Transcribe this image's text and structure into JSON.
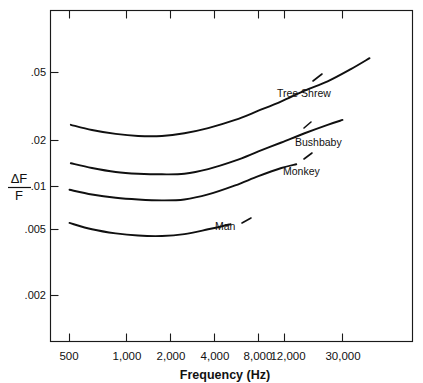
{
  "chart_data": {
    "type": "line",
    "title": "",
    "xlabel": "Frequency  (Hz)",
    "ylabel": "ΔF / F",
    "ylabel_numerator": "ΔF",
    "ylabel_denominator": "F",
    "xscale": "log",
    "yscale": "log",
    "xlim": [
      430,
      60000
    ],
    "ylim": [
      0.0013,
      0.085
    ],
    "grid": false,
    "legend": "inline-labels",
    "xticks": [
      500,
      1000,
      2000,
      4000,
      8000,
      12000,
      30000
    ],
    "xtick_labels": [
      "500",
      "1,000",
      "2,000",
      "4,000",
      "8,000",
      "12,000",
      "30,000"
    ],
    "yticks": [
      0.05,
      0.02,
      0.01,
      0.005,
      0.002
    ],
    "ytick_labels": [
      ".05",
      ".02",
      ".01",
      ".005",
      ".002"
    ],
    "series": [
      {
        "name": "Tree Shrew",
        "label": "Tree Shrew",
        "x": [
          510,
          700,
          1000,
          1400,
          2000,
          2800,
          4000,
          6000,
          8500,
          12000,
          17000,
          24000,
          34000,
          45000
        ],
        "y": [
          0.0235,
          0.0218,
          0.0206,
          0.02,
          0.02,
          0.0208,
          0.0224,
          0.0252,
          0.0288,
          0.033,
          0.0385,
          0.044,
          0.0525,
          0.0615
        ]
      },
      {
        "name": "Bushbaby",
        "label": "Bushbaby",
        "x": [
          510,
          700,
          1000,
          1400,
          2000,
          2800,
          4000,
          6000,
          8500,
          12000,
          17000,
          24000,
          30000
        ],
        "y": [
          0.0135,
          0.0126,
          0.0119,
          0.0116,
          0.0115,
          0.0116,
          0.0124,
          0.014,
          0.016,
          0.0182,
          0.0208,
          0.0235,
          0.0252
        ]
      },
      {
        "name": "Monkey",
        "label": "Monkey",
        "x": [
          500,
          700,
          1000,
          1400,
          2000,
          2800,
          4000,
          6000,
          8500,
          12000,
          15000
        ],
        "y": [
          0.0092,
          0.0086,
          0.0082,
          0.008,
          0.0079,
          0.008,
          0.0086,
          0.0098,
          0.0112,
          0.0126,
          0.0133
        ]
      },
      {
        "name": "Man",
        "label": "Man",
        "x": [
          500,
          700,
          1000,
          1400,
          2000,
          2800,
          4000,
          5000,
          5600
        ],
        "y": [
          0.0057,
          0.0052,
          0.0049,
          0.00475,
          0.00472,
          0.00485,
          0.0052,
          0.00545,
          0.0056
        ]
      }
    ],
    "series_label_positions": [
      {
        "name": "Tree Shrew",
        "x_px": 277,
        "y_px": 94
      },
      {
        "name": "Bushbaby",
        "x_px": 295,
        "y_px": 143
      },
      {
        "name": "Monkey",
        "x_px": 283,
        "y_px": 172
      },
      {
        "name": "Man",
        "x_px": 215,
        "y_px": 227
      }
    ]
  },
  "axes": {
    "x_title": "Frequency  (Hz)",
    "y_title_numerator": "ΔF",
    "y_title_denominator": "F"
  },
  "colors": {
    "background": "#ffffff",
    "axis": "#1a1a1a",
    "curve": "#101010",
    "text": "#111111"
  }
}
